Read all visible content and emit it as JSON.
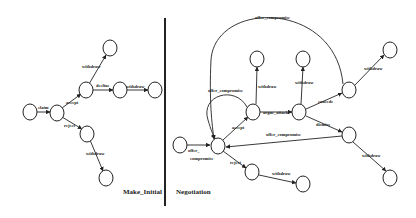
{
  "panels": {
    "left": {
      "title": "Make_Initial",
      "edges": {
        "claim": "claim",
        "accept": "accept",
        "reject": "reject",
        "withdraw_top": "withdraw",
        "decline": "decline",
        "withdraw_right": "withdraw",
        "withdraw_bottom": "withdraw"
      }
    },
    "right": {
      "title": "Negotiation",
      "edges": {
        "offer_compromise_in_1": "offer_",
        "offer_compromise_in_2": "compromise",
        "accept": "accept",
        "reject": "reject",
        "argue_attack": "argue_attack",
        "withdraw_1": "withdraw",
        "withdraw_2": "withdraw",
        "withdraw_3": "withdraw",
        "withdraw_4": "withdraw",
        "withdraw_5": "withdraw",
        "concede": "concede",
        "dismiss": "dismiss",
        "offer_compromise_loop": "offer_compromise",
        "offer_compromise_arc": "offer_compromise",
        "offer_compromise_back": "offer_compromise"
      }
    }
  },
  "colors": {
    "line": "#222222",
    "background": "#ffffff"
  }
}
